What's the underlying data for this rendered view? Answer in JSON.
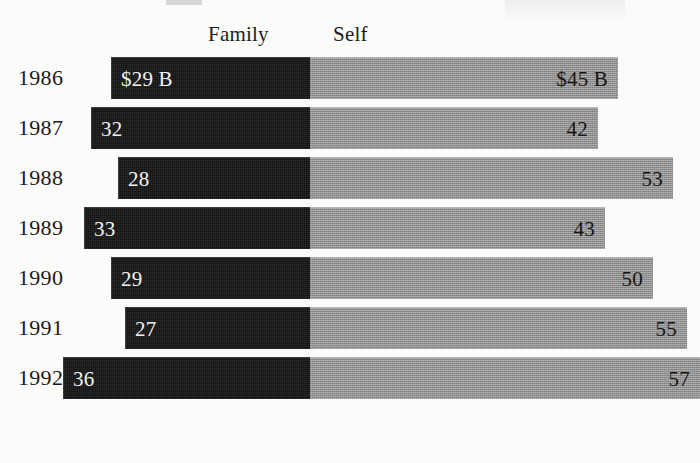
{
  "chart_data": {
    "type": "bar",
    "subtype": "diverging-stacked-horizontal",
    "title": "",
    "xlabel": "",
    "ylabel": "",
    "units": "$ billions",
    "grid": false,
    "legend_position": "top",
    "categories": [
      "1986",
      "1987",
      "1988",
      "1989",
      "1990",
      "1991",
      "1992"
    ],
    "series": [
      {
        "name": "Family",
        "direction": "left",
        "color": "#141414",
        "values": [
          29,
          32,
          28,
          33,
          29,
          27,
          36
        ],
        "labels": [
          "$29 B",
          "32",
          "28",
          "33",
          "29",
          "27",
          "36"
        ]
      },
      {
        "name": "Self",
        "direction": "right",
        "color": "#8e8e8e",
        "values": [
          45,
          42,
          53,
          43,
          50,
          55,
          57
        ],
        "labels": [
          "$45 B",
          "42",
          "53",
          "43",
          "50",
          "55",
          "57"
        ]
      }
    ],
    "axis": {
      "center_px": 310,
      "px_per_unit": 6.85
    }
  },
  "headers": {
    "family": "Family",
    "self": "Self"
  },
  "rows": [
    {
      "year": "1986",
      "family_value": 29,
      "family_label": "$29 B",
      "self_value": 45,
      "self_label": "$45 B"
    },
    {
      "year": "1987",
      "family_value": 32,
      "family_label": "32",
      "self_value": 42,
      "self_label": "42"
    },
    {
      "year": "1988",
      "family_value": 28,
      "family_label": "28",
      "self_value": 53,
      "self_label": "53"
    },
    {
      "year": "1989",
      "family_value": 33,
      "family_label": "33",
      "self_value": 43,
      "self_label": "43"
    },
    {
      "year": "1990",
      "family_value": 29,
      "family_label": "29",
      "self_value": 50,
      "self_label": "50"
    },
    {
      "year": "1991",
      "family_value": 27,
      "family_label": "27",
      "self_value": 55,
      "self_label": "55"
    },
    {
      "year": "1992",
      "family_value": 36,
      "family_label": "36",
      "self_value": 57,
      "self_label": "57"
    }
  ],
  "colors": {
    "family": "#141414",
    "self": "#8e8e8e",
    "background": "#fbfbfa",
    "text": "#1a1a1a"
  }
}
